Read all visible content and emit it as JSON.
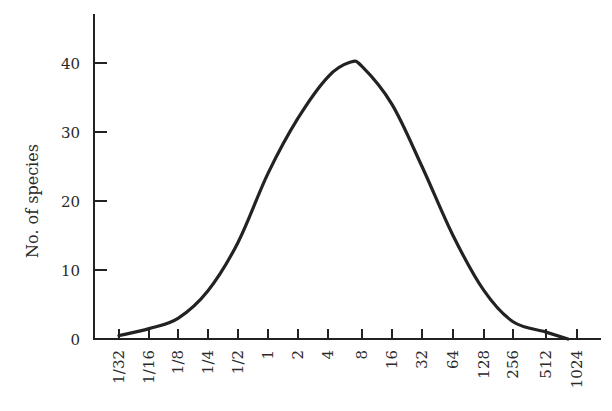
{
  "chart_data": {
    "type": "line",
    "title": "",
    "xlabel": "",
    "ylabel": "No. of species",
    "x_scale": "log2",
    "categories": [
      "1/32",
      "1/16",
      "1/8",
      "1/4",
      "1/2",
      "1",
      "2",
      "4",
      "8",
      "16",
      "32",
      "64",
      "128",
      "256",
      "512",
      "1024"
    ],
    "series": [
      {
        "name": "species distribution",
        "values": [
          0.5,
          1.5,
          3,
          7,
          14,
          24,
          32,
          38,
          39.5,
          34,
          25,
          15,
          7,
          2.5,
          1,
          0
        ]
      }
    ],
    "peak": {
      "x_between": [
        "4",
        "8"
      ],
      "y": 40
    },
    "yticks": [
      0,
      10,
      20,
      30,
      40
    ],
    "ylim": [
      0,
      45
    ],
    "grid": false,
    "legend": "none"
  }
}
